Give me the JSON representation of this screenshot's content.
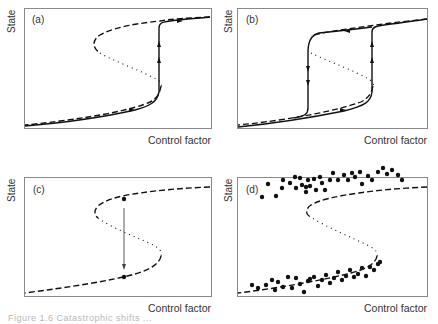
{
  "figure": {
    "axis_label_y": "State",
    "axis_label_x": "Control factor",
    "caption_partial": "Figure 1.6  Catastrophic shifts ...",
    "colors": {
      "curve": "#111111",
      "frame": "#8a8a8a",
      "text": "#333333"
    }
  },
  "panels": [
    {
      "id": "a",
      "label": "(a)",
      "description": "Hysteresis fold: system follows lower stable branch forward, then jumps up at the bifurcation point",
      "stable_branch_style": "dashed",
      "unstable_branch_style": "dotted",
      "trajectory": "solid, forward path with arrows"
    },
    {
      "id": "b",
      "label": "(b)",
      "description": "Full hysteresis loop: forward jump up at right fold, backward jump down at left fold",
      "stable_branch_style": "dashed",
      "unstable_branch_style": "dotted",
      "trajectory": "solid loop with arrows"
    },
    {
      "id": "c",
      "label": "(c)",
      "description": "Perturbation shift between alternative stable states at same control factor",
      "stable_branch_style": "dashed",
      "unstable_branch_style": "dotted",
      "trajectory": "vertical arrow from upper-branch dot to lower-branch dot"
    },
    {
      "id": "d",
      "label": "(d)",
      "description": "Scattered observations clustered around the two alternative stable branches",
      "stable_branch_style": "dashed",
      "unstable_branch_style": "dotted",
      "trajectory": "scatter points"
    }
  ],
  "geometry": {
    "fold_upper": "M0,112 C30,110 80,104 100,100 C130,94 148,86 152,82",
    "comment": "curves are drawn in panel-local coordinates (0..187 x 0..119)"
  },
  "scatter_d": {
    "upper": [
      [
        306,
        37
      ],
      [
        268,
        34
      ],
      [
        262,
        47
      ],
      [
        276,
        46
      ],
      [
        282,
        38
      ],
      [
        283,
        30
      ],
      [
        290,
        33
      ],
      [
        295,
        27
      ],
      [
        296,
        38
      ],
      [
        300,
        28
      ],
      [
        302,
        35
      ],
      [
        306,
        42
      ],
      [
        308,
        30
      ],
      [
        310,
        36
      ],
      [
        314,
        29
      ],
      [
        316,
        40
      ],
      [
        320,
        27
      ],
      [
        322,
        33
      ],
      [
        325,
        40
      ],
      [
        330,
        30
      ],
      [
        333,
        23
      ],
      [
        338,
        30
      ],
      [
        344,
        25
      ],
      [
        348,
        30
      ],
      [
        352,
        23
      ],
      [
        355,
        27
      ],
      [
        360,
        22
      ],
      [
        362,
        34
      ],
      [
        368,
        26
      ],
      [
        372,
        30
      ],
      [
        378,
        22
      ],
      [
        383,
        18
      ],
      [
        387,
        24
      ],
      [
        392,
        20
      ],
      [
        398,
        25
      ],
      [
        402,
        30
      ]
    ],
    "lower": [
      [
        252,
        135
      ],
      [
        258,
        138
      ],
      [
        266,
        135
      ],
      [
        272,
        130
      ],
      [
        275,
        140
      ],
      [
        278,
        132
      ],
      [
        283,
        137
      ],
      [
        288,
        127
      ],
      [
        292,
        138
      ],
      [
        296,
        128
      ],
      [
        300,
        134
      ],
      [
        304,
        142
      ],
      [
        308,
        131
      ],
      [
        310,
        129
      ],
      [
        314,
        127
      ],
      [
        318,
        136
      ],
      [
        322,
        130
      ],
      [
        326,
        125
      ],
      [
        330,
        133
      ],
      [
        334,
        128
      ],
      [
        338,
        122
      ],
      [
        342,
        130
      ],
      [
        346,
        126
      ],
      [
        350,
        120
      ],
      [
        354,
        127
      ],
      [
        358,
        124
      ],
      [
        362,
        118
      ],
      [
        366,
        126
      ],
      [
        370,
        117
      ],
      [
        374,
        120
      ],
      [
        378,
        114
      ],
      [
        380,
        112
      ]
    ]
  }
}
